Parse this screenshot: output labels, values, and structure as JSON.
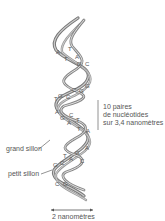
{
  "diagram": {
    "title": "",
    "labels": {
      "pairs_line1": "10 paires",
      "pairs_line2": "de nucléotides",
      "pairs_line3": "sur 3,4 nanomètres",
      "major_groove": "grand sillon",
      "minor_groove": "petit sillon",
      "width": "2 nanomètres"
    },
    "bases": [
      {
        "l": "A",
        "x": 56,
        "y": 54
      },
      {
        "l": "T",
        "x": 68,
        "y": 51
      },
      {
        "l": "T",
        "x": 64,
        "y": 61
      },
      {
        "l": "A",
        "x": 75,
        "y": 59
      },
      {
        "l": "G",
        "x": 77,
        "y": 66
      },
      {
        "l": "C",
        "x": 85,
        "y": 66
      },
      {
        "l": "G",
        "x": 85,
        "y": 88
      },
      {
        "l": "C",
        "x": 72,
        "y": 92
      },
      {
        "l": "G",
        "x": 79,
        "y": 93
      },
      {
        "l": "G",
        "x": 58,
        "y": 98
      },
      {
        "l": "C",
        "x": 66,
        "y": 99
      },
      {
        "l": "T",
        "x": 54,
        "y": 101
      },
      {
        "l": "A",
        "x": 55,
        "y": 114
      },
      {
        "l": "G",
        "x": 60,
        "y": 120
      },
      {
        "l": "C",
        "x": 69,
        "y": 117
      },
      {
        "l": "A",
        "x": 67,
        "y": 125
      },
      {
        "l": "T",
        "x": 76,
        "y": 122
      },
      {
        "l": "T",
        "x": 77,
        "y": 131
      },
      {
        "l": "A",
        "x": 86,
        "y": 133
      },
      {
        "l": "A",
        "x": 85,
        "y": 150
      },
      {
        "l": "G",
        "x": 75,
        "y": 155
      },
      {
        "l": "A",
        "x": 69,
        "y": 161
      },
      {
        "l": "T",
        "x": 63,
        "y": 158
      },
      {
        "l": "C",
        "x": 80,
        "y": 163
      },
      {
        "l": "G",
        "x": 53,
        "y": 167
      },
      {
        "l": "C",
        "x": 60,
        "y": 165
      },
      {
        "l": "C",
        "x": 55,
        "y": 186
      },
      {
        "l": "G",
        "x": 63,
        "y": 186
      }
    ]
  }
}
